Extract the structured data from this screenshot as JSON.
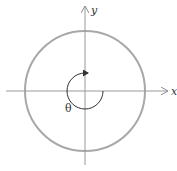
{
  "diagram": {
    "type": "unit-circle-angle",
    "axes": {
      "x_label": "x",
      "y_label": "y"
    },
    "angle_label": "θ",
    "colors": {
      "circle": "#a8a8a8",
      "axes": "#9a9a9a",
      "arc": "#333333",
      "text": "#333333"
    }
  }
}
